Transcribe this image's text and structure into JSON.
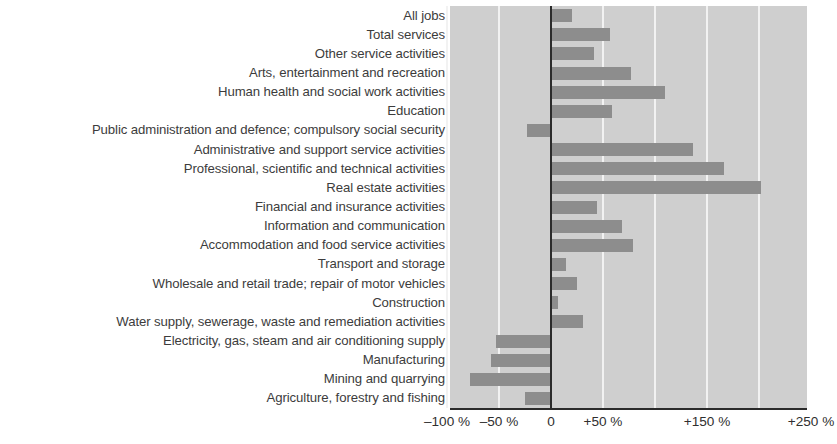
{
  "chart_data": {
    "type": "bar",
    "orientation": "horizontal",
    "title": "",
    "subtitle": "",
    "xlabel": "",
    "ylabel": "",
    "xlim": [
      -120,
      250
    ],
    "grid": true,
    "legend": false,
    "bar_color": "#8d8d8d",
    "plot_background": "#cfcfcf",
    "gridline_color": "#f2f2f2",
    "zero_line_color": "#2b2b2b",
    "axis_ticks": [
      {
        "value": -100,
        "label": "–100 %"
      },
      {
        "value": -50,
        "label": "–50 %"
      },
      {
        "value": 0,
        "label": "0"
      },
      {
        "value": 50,
        "label": "+50 %"
      },
      {
        "value": 150,
        "label": "+150 %"
      },
      {
        "value": 250,
        "label": "+250 %"
      }
    ],
    "gridline_values": [
      -100,
      -50,
      50,
      100,
      150,
      200
    ],
    "categories": [
      "All jobs",
      "Total services",
      "Other service activities",
      "Arts, entertainment and recreation",
      "Human health and social work activities",
      "Education",
      "Public administration and defence; compulsory social security",
      "Administrative and support service activities",
      "Professional, scientific and technical activities",
      "Real estate activities",
      "Financial and insurance activities",
      "Information and communication",
      "Accommodation and food service activities",
      "Transport and storage",
      "Wholesale and retail trade; repair of motor vehicles",
      "Construction",
      "Water supply, sewerage, waste and remediation activities",
      "Electricity, gas, steam and air conditioning supply",
      "Manufacturing",
      "Mining and quarrying",
      "Agriculture, forestry and fishing"
    ],
    "values": [
      20,
      57,
      41,
      77,
      110,
      59,
      -23,
      137,
      166,
      202,
      44,
      68,
      79,
      14,
      25,
      7,
      31,
      -53,
      -58,
      -78,
      -25
    ]
  }
}
